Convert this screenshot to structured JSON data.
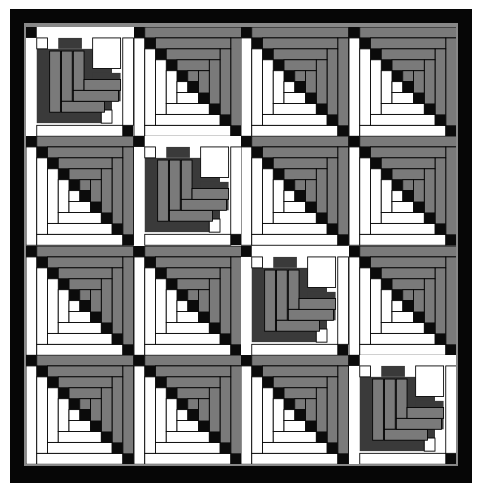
{
  "quilt": {
    "rows": 4,
    "cols": 4,
    "colors": {
      "black": "#0b0b0b",
      "dark": "#3a3a3a",
      "mid": "#7a7a7a",
      "light": "#ffffff",
      "border": "#060606",
      "edge": "#888888"
    },
    "heart_blocks": [
      [
        0,
        0
      ],
      [
        1,
        1
      ],
      [
        2,
        2
      ],
      [
        3,
        3
      ]
    ],
    "pattern": "log-cabin diagonal with heart blocks on main diagonal"
  }
}
